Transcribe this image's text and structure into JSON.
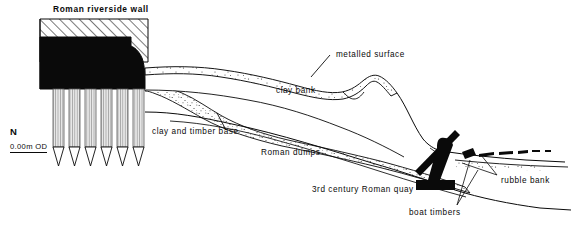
{
  "figure": {
    "type": "archaeological-section-drawing",
    "title": "Roman riverside wall",
    "orientation_marker": "N",
    "datum_label": "0.00m OD",
    "width_px": 571,
    "height_px": 246,
    "background_color": "#ffffff",
    "ink_color": "#0a0a0a"
  },
  "labels": {
    "wall_title": "Roman riverside wall",
    "metalled_surface": "metalled surface",
    "clay_bank": "clay bank",
    "clay_and_timber_base": "clay and timber base",
    "roman_dumps": "Roman dumps",
    "roman_quay": "3rd century Roman quay",
    "boat_timbers": "boat timbers",
    "rubble_bank": "rubble bank",
    "north": "N",
    "datum": "0.00m OD"
  },
  "features": {
    "wall": {
      "name": "Roman riverside wall",
      "hatched_cap": true,
      "solid_core": true,
      "pile_count": 6
    },
    "strata": [
      {
        "name": "metalled surface",
        "fill": "stipple"
      },
      {
        "name": "clay bank",
        "fill": "blank"
      },
      {
        "name": "clay and timber base",
        "fill": "stipple"
      },
      {
        "name": "Roman dumps",
        "fill": "blank"
      }
    ],
    "quay": {
      "name": "3rd century Roman quay",
      "period": "3rd century",
      "fill": "solid-black"
    },
    "boat_timbers": {
      "name": "boat timbers",
      "fill": "solid-black"
    },
    "rubble_bank": {
      "name": "rubble bank",
      "fill": "dashes"
    }
  }
}
